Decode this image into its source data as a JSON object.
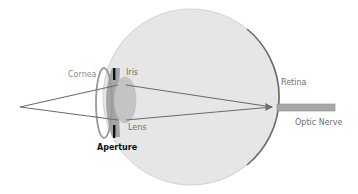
{
  "diagram": {
    "labels": {
      "cornea": "Cornea",
      "iris": "Iris",
      "lens": "Lens",
      "aperture": "Aperture",
      "retina": "Retina",
      "optic_nerve": "Optic Nerve"
    },
    "colors": {
      "eyeball_fill": "#e6e6e6",
      "eyeball_edge": "#cfcfcf",
      "retina": "#6a6a6a",
      "iris": "#a6a6a6",
      "lens": "#c4c4c4",
      "cornea": "#9a9a9a",
      "aperture_bars": "#111111",
      "rays": "#6b6b6b",
      "optic_nerve": "#a8a8a8"
    }
  }
}
